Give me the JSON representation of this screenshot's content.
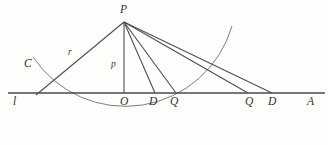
{
  "figure": {
    "kind": "geometry-diagram",
    "background_color": "#fdfdfc",
    "stroke_color": "#555555",
    "label_color": "#2e2e2e",
    "width": 328,
    "height": 145,
    "points": [
      {
        "id": "P",
        "label": "P",
        "x": 124,
        "y": 22,
        "label_x": 120,
        "label_y": 4
      },
      {
        "id": "C",
        "label": "C",
        "x": 38,
        "y": 70,
        "label_x": 24,
        "label_y": 58
      },
      {
        "id": "l",
        "label": "l",
        "x": 16,
        "y": 93,
        "label_x": 13,
        "label_y": 96
      },
      {
        "id": "O",
        "label": "O",
        "x": 124,
        "y": 93,
        "label_x": 120,
        "label_y": 96
      },
      {
        "id": "D1",
        "label": "D",
        "x": 155,
        "y": 93,
        "label_x": 149,
        "label_y": 96
      },
      {
        "id": "Q1",
        "label": "Q",
        "x": 176,
        "y": 93,
        "label_x": 170,
        "label_y": 96
      },
      {
        "id": "Q2",
        "label": "Q",
        "x": 248,
        "y": 93,
        "label_x": 245,
        "label_y": 96
      },
      {
        "id": "D2",
        "label": "D",
        "x": 272,
        "y": 93,
        "label_x": 268,
        "label_y": 96
      },
      {
        "id": "A",
        "label": "A",
        "x": 318,
        "y": 93,
        "label_x": 307,
        "label_y": 96
      }
    ],
    "segment_labels": [
      {
        "id": "r",
        "label": "r",
        "x": 68,
        "y": 48,
        "describes": "radius PC"
      },
      {
        "id": "p",
        "label": "p",
        "x": 111,
        "y": 60,
        "describes": "perpendicular PO"
      }
    ],
    "baseline": {
      "x1": 8,
      "y1": 93,
      "x2": 325,
      "y2": 93
    },
    "rays_from_P": [
      {
        "to": "C-intersection",
        "x": 38,
        "y": 93
      },
      {
        "to": "O",
        "x": 124,
        "y": 93
      },
      {
        "to": "D1",
        "x": 155,
        "y": 93
      },
      {
        "to": "Q1",
        "x": 176,
        "y": 93
      },
      {
        "to": "Q2",
        "x": 248,
        "y": 93
      },
      {
        "to": "D2",
        "x": 272,
        "y": 93
      }
    ],
    "arc": {
      "center_x": 124,
      "center_y": 22,
      "radius": 111,
      "start_x": 33,
      "start_y": 57,
      "end_x": 232,
      "end_y": 26,
      "note": "circular arc centered at P through C and sweeping below the baseline"
    }
  }
}
